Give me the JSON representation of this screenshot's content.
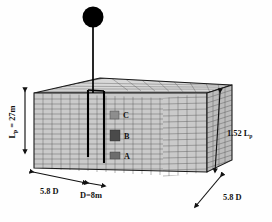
{
  "figure": {
    "type": "engineering-diagram",
    "pile": {
      "head_mass_icon": "filled-circle-mass",
      "shaft_icon": "vertical-rod"
    },
    "labels": {
      "pile_length": {
        "prefix": "L",
        "sub": "p",
        "rest": " = 27m"
      },
      "block_depth": {
        "prefix": "1.52 L",
        "sub": "p",
        "rest": ""
      },
      "width_left": "5.8 D",
      "pile_diameter": "D=8m",
      "width_right": "5.8 D"
    },
    "zones": [
      {
        "id": "C",
        "label": "C",
        "color": "#8d8d8d"
      },
      {
        "id": "B",
        "label": "B",
        "color": "#4a4a4a"
      },
      {
        "id": "A",
        "label": "A",
        "color": "#6d6d6d"
      }
    ],
    "colors": {
      "soil_front": "#c9c9c9",
      "soil_side": "#b9b9b9",
      "soil_top": "#d6d6d6",
      "mesh": "#5a5a5a",
      "outline": "#1a1a1a",
      "pile": "#000000"
    }
  }
}
